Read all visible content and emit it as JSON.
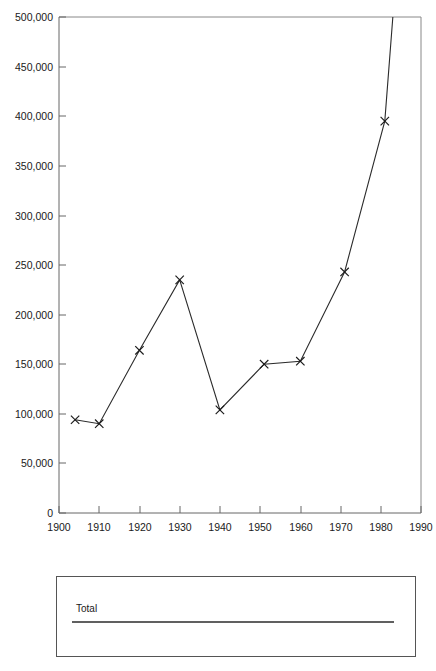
{
  "chart_data": {
    "type": "line",
    "title": "",
    "subtitle": "",
    "xlabel": "",
    "ylabel": "",
    "xlim": [
      1900,
      1990
    ],
    "ylim": [
      0,
      500000
    ],
    "grid": false,
    "legend_position": "bottom",
    "series": [
      {
        "name": "Total",
        "marker": "x",
        "x": [
          1904,
          1910,
          1920,
          1930,
          1940,
          1951,
          1960,
          1971,
          1981,
          1983
        ],
        "values": [
          94000,
          90000,
          164000,
          235000,
          104000,
          150000,
          153000,
          243000,
          395000,
          500000
        ],
        "note_last_point_clipped": "line continues past top of plot area at 500,000"
      }
    ],
    "x_ticks": [
      1900,
      1910,
      1920,
      1930,
      1940,
      1950,
      1960,
      1970,
      1980,
      1990
    ],
    "x_tick_labels": [
      "1900",
      "1910",
      "1920",
      "1930",
      "1940",
      "1950",
      "1960",
      "1970",
      "1980",
      "1990"
    ],
    "y_ticks": [
      0,
      50000,
      100000,
      150000,
      200000,
      250000,
      300000,
      350000,
      400000,
      450000,
      500000
    ],
    "y_tick_labels": [
      "0",
      "50,000",
      "100,000",
      "150,000",
      "200,000",
      "250,000",
      "300,000",
      "350,000",
      "400,000",
      "450,000",
      "500,000"
    ]
  },
  "legend": {
    "entries": [
      {
        "label": "Total"
      }
    ]
  },
  "colors": {
    "background": "#ffffff",
    "series_line": "#2b2b2b",
    "axis": "#666666",
    "frame": "#888888",
    "text": "#1a1a1a",
    "legend_border": "#555555"
  }
}
